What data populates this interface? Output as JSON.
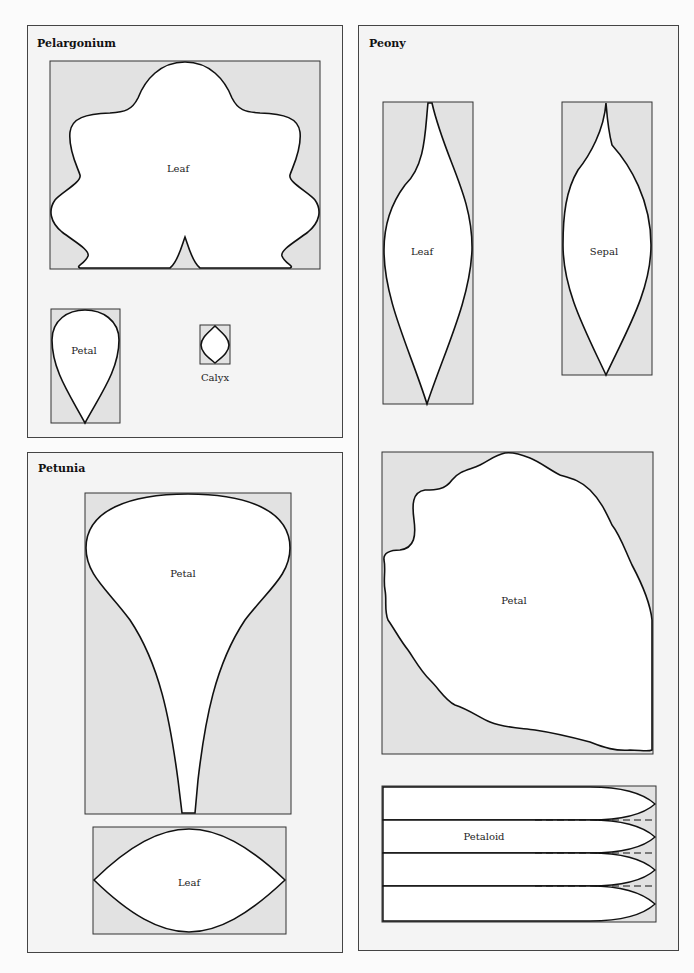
{
  "panels": {
    "pelargonium": {
      "title": "Pelargonium",
      "shapes": {
        "leaf": "Leaf",
        "petal": "Petal",
        "calyx": "Calyx"
      }
    },
    "petunia": {
      "title": "Petunia",
      "shapes": {
        "petal": "Petal",
        "leaf": "Leaf"
      }
    },
    "peony": {
      "title": "Peony",
      "shapes": {
        "leaf": "Leaf",
        "sepal": "Sepal",
        "petal": "Petal",
        "petaloid": "Petaloid"
      }
    }
  },
  "colors": {
    "template_bg": "#e2e2e2",
    "shape_fill": "#ffffff",
    "outline": "#111111",
    "panel_bg": "#f4f4f4"
  }
}
